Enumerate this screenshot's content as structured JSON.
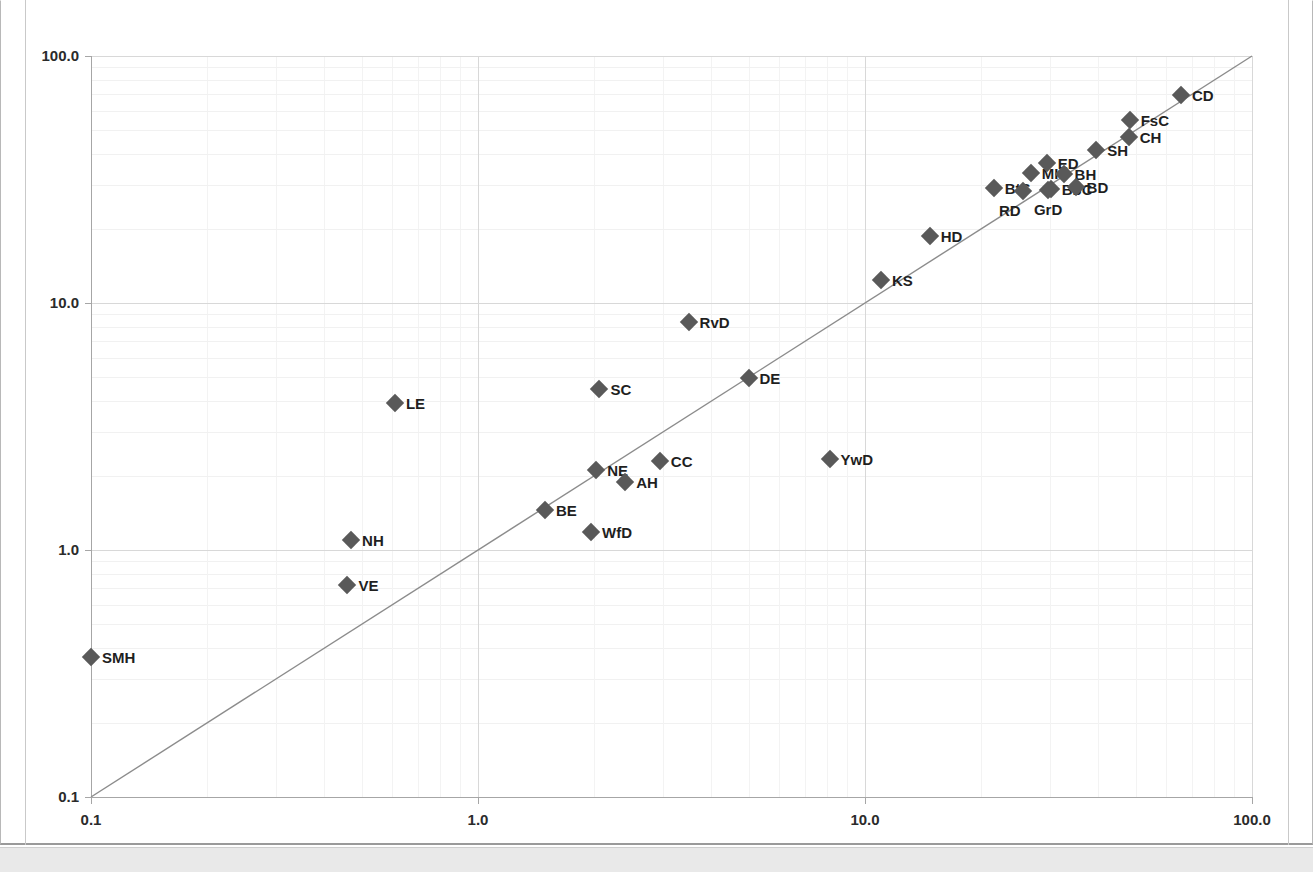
{
  "window": {
    "background_color": "#ffffff",
    "taskbar_color": "#e9e9e9"
  },
  "chart_data": {
    "type": "scatter",
    "title": "",
    "subtitle": "",
    "xlabel": "",
    "ylabel": "",
    "xscale": "log",
    "yscale": "log",
    "xlim": [
      0.1,
      100.0
    ],
    "ylim": [
      0.1,
      100.0
    ],
    "grid": true,
    "legend": "none",
    "marker_style": "filled-diamond",
    "marker_color": "#595959",
    "reference_line": {
      "label": "y = x identity line",
      "from": [
        0.1,
        0.1
      ],
      "to": [
        100.0,
        100.0
      ],
      "color": "#8c8c8c"
    },
    "x_ticks": [
      "0.1",
      "1.0",
      "10.0",
      "100.0"
    ],
    "x_tick_values": [
      0.1,
      1.0,
      10.0,
      100.0
    ],
    "y_ticks": [
      "0.1",
      "1.0",
      "10.0",
      "100.0"
    ],
    "y_tick_values": [
      0.1,
      1.0,
      10.0,
      100.0
    ],
    "points": [
      {
        "label": "SMH",
        "x": 0.1,
        "y": 0.37,
        "label_side": "right"
      },
      {
        "label": "VE",
        "x": 0.46,
        "y": 0.72,
        "label_side": "right"
      },
      {
        "label": "NH",
        "x": 0.47,
        "y": 1.1,
        "label_side": "right"
      },
      {
        "label": "LE",
        "x": 0.61,
        "y": 3.95,
        "label_side": "right"
      },
      {
        "label": "BE",
        "x": 1.49,
        "y": 1.45,
        "label_side": "right"
      },
      {
        "label": "WfD",
        "x": 1.96,
        "y": 1.18,
        "label_side": "right"
      },
      {
        "label": "NE",
        "x": 2.02,
        "y": 2.1,
        "label_side": "right"
      },
      {
        "label": "SC",
        "x": 2.06,
        "y": 4.5,
        "label_side": "right"
      },
      {
        "label": "AH",
        "x": 2.4,
        "y": 1.88,
        "label_side": "right"
      },
      {
        "label": "CC",
        "x": 2.95,
        "y": 2.3,
        "label_side": "right"
      },
      {
        "label": "RvD",
        "x": 3.5,
        "y": 8.4,
        "label_side": "right"
      },
      {
        "label": "DE",
        "x": 5.0,
        "y": 4.95,
        "label_side": "right"
      },
      {
        "label": "YwD",
        "x": 8.1,
        "y": 2.33,
        "label_side": "right"
      },
      {
        "label": "KS",
        "x": 11.0,
        "y": 12.4,
        "label_side": "right"
      },
      {
        "label": "HD",
        "x": 14.7,
        "y": 18.6,
        "label_side": "right"
      },
      {
        "label": "BtS",
        "x": 21.5,
        "y": 29.3,
        "label_side": "right"
      },
      {
        "label": "RD",
        "x": 25.6,
        "y": 28.5,
        "label_side": "below-left"
      },
      {
        "label": "MH",
        "x": 26.8,
        "y": 33.5,
        "label_side": "right"
      },
      {
        "label": "ED",
        "x": 29.5,
        "y": 37.0,
        "label_side": "right"
      },
      {
        "label": "GrD",
        "x": 29.7,
        "y": 28.6,
        "label_side": "below"
      },
      {
        "label": "BbC",
        "x": 30.2,
        "y": 29.0,
        "label_side": "right"
      },
      {
        "label": "BH",
        "x": 32.6,
        "y": 33.2,
        "label_side": "right"
      },
      {
        "label": "BD",
        "x": 35.0,
        "y": 29.4,
        "label_side": "right"
      },
      {
        "label": "SH",
        "x": 39.6,
        "y": 41.8,
        "label_side": "right"
      },
      {
        "label": "CH",
        "x": 48.0,
        "y": 47.0,
        "label_side": "right"
      },
      {
        "label": "FsC",
        "x": 48.3,
        "y": 55.0,
        "label_side": "right"
      },
      {
        "label": "CD",
        "x": 65.5,
        "y": 69.5,
        "label_side": "right"
      }
    ]
  }
}
